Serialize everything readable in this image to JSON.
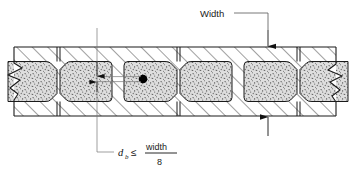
{
  "figure": {
    "title_caption": "",
    "type": "masonry-wall-plan-section",
    "labels": {
      "width_label": "Width",
      "formula_variable": "d",
      "formula_subscript": "b",
      "formula_relation": "≤",
      "formula_numerator": "width",
      "formula_denominator": "8"
    },
    "annotations": [
      {
        "name": "width-callout",
        "text": "Width",
        "x": 200,
        "y": 13
      },
      {
        "name": "bar-diameter-note",
        "text": "d_b ≤ width / 8",
        "x": 118,
        "y": 152
      }
    ],
    "colors": {
      "line": "#1a1a1a",
      "hatch": "#2b2b2b",
      "grout_fill": "#d9d9d9",
      "grout_speckle": "#4a4a4a",
      "rebar": "#000000",
      "background": "#ffffff",
      "thin_line": "#555555"
    },
    "geometry": {
      "wall_top_y": 47,
      "wall_bottom_y": 116,
      "face_shell_thickness": 14,
      "left_break_x": 14,
      "right_break_x": 336,
      "head_joints_x": [
        58.5,
        178.5,
        298.5
      ],
      "rebar": {
        "x": 143,
        "y": 79,
        "r": 4.2
      },
      "bar_dim_line_x": 97,
      "bar_dim_top_y": 62,
      "bar_dim_bottom_y": 92,
      "width_dim_x": 268
    }
  }
}
